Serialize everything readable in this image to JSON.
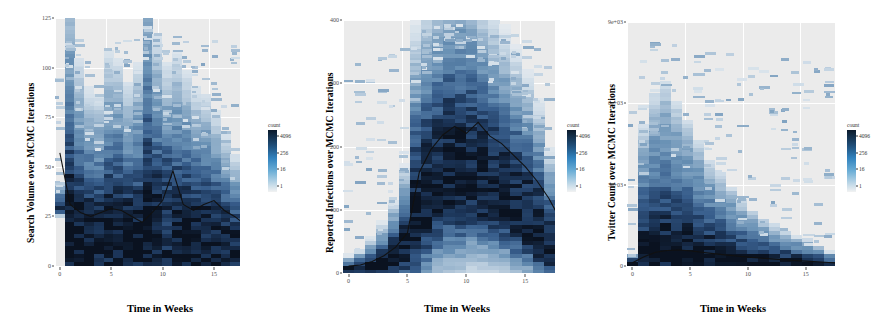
{
  "figure": {
    "legend_title": "count",
    "legend_ticks": [
      "4096",
      "256",
      "16",
      "1"
    ],
    "xlabel": "Time in Weeks"
  },
  "chart_data": [
    {
      "type": "heatmap",
      "panel": 1,
      "title": "",
      "ylabel": "Search Volume over MCMC Iterations",
      "xlabel": "Time in Weeks",
      "xticks": [
        "0",
        "5",
        "10",
        "15"
      ],
      "xlim": [
        0,
        18
      ],
      "yticks": [
        "125",
        "100",
        "75",
        "50",
        "25",
        "0"
      ],
      "ylim": [
        0,
        125
      ],
      "legend_title": "count",
      "legend_ticks": [
        "4096",
        "256",
        "16",
        "1"
      ],
      "legend_scale": "log",
      "grid": true,
      "median_label": "posterior median",
      "median_x": [
        0,
        1,
        2,
        3,
        4,
        5,
        6,
        7,
        8,
        9,
        10,
        11,
        12,
        13,
        14,
        15,
        16,
        17,
        18
      ],
      "median_y": [
        57,
        31,
        27,
        25,
        27,
        29,
        28,
        25,
        22,
        27,
        33,
        48,
        31,
        28,
        31,
        33,
        28,
        25,
        21
      ],
      "band_upper": [
        38,
        95,
        70,
        60,
        58,
        72,
        70,
        62,
        68,
        105,
        78,
        68,
        72,
        66,
        60,
        58,
        52,
        44,
        38
      ],
      "band_lower": [
        30,
        10,
        8,
        7,
        7,
        9,
        9,
        8,
        8,
        10,
        9,
        8,
        9,
        9,
        8,
        7,
        7,
        6,
        5
      ]
    },
    {
      "type": "heatmap",
      "panel": 2,
      "title": "",
      "ylabel": "Reported Infections over MCMC Iterations",
      "xlabel": "Time in Weeks",
      "xticks": [
        "0",
        "5",
        "10",
        "15"
      ],
      "xlim": [
        0,
        18
      ],
      "yticks": [
        "400",
        "300",
        "200",
        "100",
        "0"
      ],
      "ylim": [
        0,
        440
      ],
      "legend_title": "count",
      "legend_ticks": [
        "4096",
        "256",
        "16",
        "1"
      ],
      "legend_scale": "log",
      "grid": true,
      "median_label": "posterior median",
      "median_x": [
        0,
        1,
        2,
        3,
        4,
        5,
        6,
        7,
        8,
        9,
        10,
        11,
        12,
        13,
        14,
        15,
        16,
        17,
        18
      ],
      "median_y": [
        12,
        14,
        20,
        30,
        45,
        70,
        175,
        215,
        240,
        255,
        243,
        262,
        238,
        225,
        205,
        185,
        160,
        130,
        92
      ],
      "band_upper": [
        22,
        28,
        42,
        60,
        88,
        130,
        300,
        340,
        370,
        400,
        392,
        378,
        352,
        330,
        305,
        280,
        250,
        210,
        150
      ],
      "band_lower": [
        5,
        6,
        9,
        14,
        22,
        34,
        80,
        110,
        135,
        150,
        148,
        152,
        140,
        130,
        118,
        100,
        85,
        62,
        38
      ]
    },
    {
      "type": "heatmap",
      "panel": 3,
      "title": "",
      "ylabel": "Twitter Count over MCMC Iterations",
      "xlabel": "Time in Weeks",
      "xticks": [
        "0",
        "5",
        "10",
        "15"
      ],
      "xlim": [
        0,
        18
      ],
      "yticks": [
        "9e+03",
        "6e+03",
        "3e+03",
        "0"
      ],
      "ylim": [
        0,
        11000
      ],
      "legend_title": "count",
      "legend_ticks": [
        "4096",
        "256",
        "16",
        "1"
      ],
      "legend_scale": "log",
      "grid": true,
      "median_label": "posterior median",
      "median_x": [
        0,
        1,
        2,
        3,
        4,
        5,
        6,
        7,
        8,
        9,
        10,
        11,
        12,
        13,
        14,
        15,
        16,
        17,
        18
      ],
      "median_y": [
        150,
        420,
        620,
        700,
        720,
        680,
        620,
        560,
        500,
        450,
        400,
        360,
        320,
        280,
        250,
        220,
        190,
        160,
        120
      ],
      "band_upper": [
        400,
        4200,
        5200,
        5600,
        5000,
        4400,
        3800,
        3200,
        2800,
        2400,
        2000,
        1700,
        1450,
        1250,
        1050,
        900,
        780,
        650,
        420
      ],
      "band_lower": [
        40,
        90,
        130,
        150,
        150,
        140,
        130,
        120,
        110,
        100,
        90,
        80,
        70,
        62,
        55,
        48,
        42,
        36,
        25
      ]
    }
  ]
}
